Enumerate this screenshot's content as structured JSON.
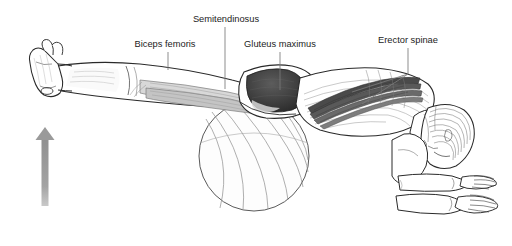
{
  "illustration": {
    "title": "Prone back extension on stability ball — posterior chain musculature",
    "background_color": "#ffffff",
    "width": 512,
    "height": 246
  },
  "labels": [
    {
      "id": "biceps-femoris",
      "text": "Biceps femoris",
      "x": 165,
      "y": 47,
      "anchor": "middle",
      "leader": {
        "x1": 168,
        "y1": 52,
        "x2": 168,
        "y2": 70
      }
    },
    {
      "id": "semitendinosus",
      "text": "Semitendinosus",
      "x": 226,
      "y": 22,
      "anchor": "middle",
      "leader": {
        "x1": 225,
        "y1": 27,
        "x2": 225,
        "y2": 89
      }
    },
    {
      "id": "gluteus-maximus",
      "text": "Gluteus maximus",
      "x": 280,
      "y": 47,
      "anchor": "middle",
      "leader": {
        "x1": 280,
        "y1": 52,
        "x2": 280,
        "y2": 90
      }
    },
    {
      "id": "erector-spinae",
      "text": "Erector spinae",
      "x": 408,
      "y": 43,
      "anchor": "middle",
      "leader": {
        "x1": 408,
        "y1": 48,
        "x2": 408,
        "y2": 74
      },
      "branches": [
        {
          "x1": 408,
          "y1": 74,
          "x2": 352,
          "y2": 92
        },
        {
          "x1": 408,
          "y1": 74,
          "x2": 362,
          "y2": 104
        }
      ]
    }
  ],
  "arrow": {
    "name": "upward-force-arrow",
    "color": "#9a9a9a",
    "x": 45,
    "shaft_top": 140,
    "shaft_bottom": 206,
    "shaft_width": 7,
    "head_width": 19,
    "head_top": 127,
    "direction": "up"
  },
  "ball": {
    "name": "stability-ball",
    "center_x": 254,
    "center_y": 156,
    "radius": 55,
    "outline_color": "#5a5a5a",
    "fill_color": "#fdfdfd",
    "meridian_count": 7
  },
  "anatomy": {
    "muscles": [
      {
        "id": "biceps-femoris",
        "name": "Biceps femoris",
        "region": "posterior thigh",
        "shade": "#c9c9c9"
      },
      {
        "id": "semitendinosus",
        "name": "Semitendinosus",
        "region": "posterior thigh",
        "shade": "#d4d4d4"
      },
      {
        "id": "gluteus-maximus",
        "name": "Gluteus maximus",
        "region": "buttock",
        "shade": "#3d3d3d"
      },
      {
        "id": "erector-spinae",
        "name": "Erector spinae",
        "region": "posterior trunk",
        "shade": "#6b6b6b"
      }
    ],
    "body_parts": [
      {
        "id": "foot",
        "name": "Foot"
      },
      {
        "id": "leg",
        "name": "Leg"
      },
      {
        "id": "thigh",
        "name": "Thigh"
      },
      {
        "id": "pelvis",
        "name": "Pelvis"
      },
      {
        "id": "back",
        "name": "Back / ribcage"
      },
      {
        "id": "head",
        "name": "Head"
      },
      {
        "id": "forearms",
        "name": "Forearms"
      },
      {
        "id": "hands",
        "name": "Hands"
      }
    ],
    "line_color": "#2a2a2a",
    "fill_color": "#ffffff"
  }
}
